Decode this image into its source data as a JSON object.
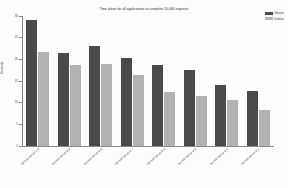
{
  "chart_data": {
    "type": "bar",
    "title": "Time taken for all applications to complete 10,000 requests",
    "xlabel": "Webserver / application",
    "ylabel": "Seconds",
    "ylim": [
      0,
      30
    ],
    "yticks": [
      0,
      5,
      10,
      15,
      20,
      25,
      30
    ],
    "ytick_labels": [
      "0",
      "5",
      "10",
      "15",
      "20",
      "25",
      "30"
    ],
    "grid": false,
    "legend_position": "top-right",
    "categories": [
      "net-http-server 1.0",
      "net-http-server 0.9",
      "net-http-server 0.8",
      "net-http-server 0.7",
      "net-http-server 0.6",
      "net-http-server 0.5",
      "net-http-server 0.4",
      "net-http-server 0.3"
    ],
    "series": [
      {
        "name": "Ubuntu",
        "color": "#4a4a4a",
        "values": [
          29.0,
          21.5,
          23.0,
          20.2,
          18.6,
          17.6,
          14.1,
          12.8
        ]
      },
      {
        "name": "Debian",
        "color": "#b2b2b2",
        "values": [
          21.8,
          18.6,
          19.0,
          16.5,
          12.4,
          11.5,
          10.6,
          8.4
        ]
      }
    ]
  }
}
